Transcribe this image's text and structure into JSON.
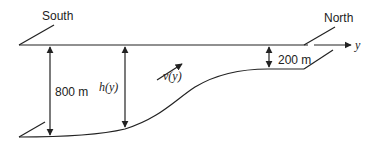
{
  "diagram": {
    "labels": {
      "south": "South",
      "north": "North",
      "axis": "y",
      "depth_south": "800 m",
      "depth_north": "200 m",
      "depth_function": "h(y)",
      "velocity_function": "v(y)"
    },
    "colors": {
      "stroke": "#222222",
      "background": "#ffffff"
    }
  }
}
